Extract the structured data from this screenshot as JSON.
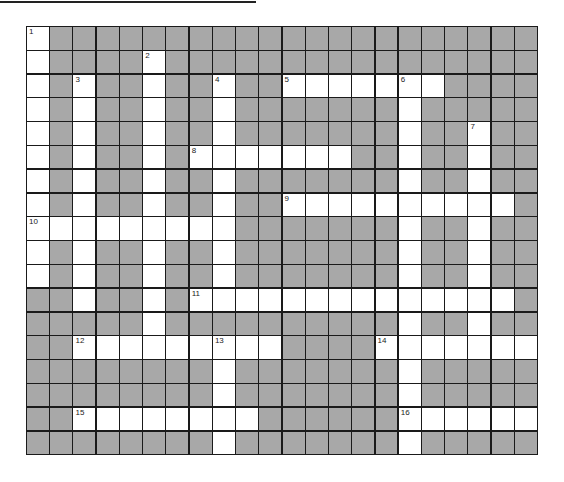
{
  "puzzle": {
    "rows": 18,
    "cols": 22,
    "colors": {
      "block": "#a8a8a8",
      "open": "#ffffff",
      "line": "#1a1a1a"
    },
    "open_cells": {
      "0": [
        0
      ],
      "1": [
        0,
        5
      ],
      "2": [
        0,
        2,
        5,
        8,
        11,
        12,
        13,
        14,
        15,
        16,
        17
      ],
      "3": [
        0,
        2,
        5,
        8,
        16
      ],
      "4": [
        0,
        2,
        5,
        8,
        16,
        19
      ],
      "5": [
        0,
        2,
        5,
        7,
        8,
        9,
        10,
        11,
        12,
        13,
        16,
        19
      ],
      "6": [
        0,
        2,
        5,
        8,
        16,
        19
      ],
      "7": [
        0,
        2,
        5,
        8,
        11,
        12,
        13,
        14,
        15,
        16,
        17,
        18,
        19,
        20
      ],
      "8": [
        0,
        1,
        2,
        3,
        4,
        5,
        6,
        7,
        8,
        16,
        19
      ],
      "9": [
        0,
        2,
        5,
        8,
        16,
        19
      ],
      "10": [
        0,
        2,
        5,
        8,
        16,
        19
      ],
      "11": [
        2,
        5,
        7,
        8,
        9,
        10,
        11,
        12,
        13,
        14,
        15,
        16,
        17,
        18,
        19,
        20
      ],
      "12": [
        5,
        16,
        19
      ],
      "13": [
        2,
        3,
        4,
        5,
        6,
        7,
        8,
        9,
        10,
        15,
        16,
        17,
        18,
        19,
        20,
        21
      ],
      "14": [
        8,
        16
      ],
      "15": [
        8,
        16
      ],
      "16": [
        2,
        3,
        4,
        5,
        6,
        7,
        8,
        9,
        16,
        17,
        18,
        19,
        20,
        21
      ],
      "17": [
        8,
        16
      ]
    },
    "numbers": [
      {
        "n": "1",
        "r": 0,
        "c": 0
      },
      {
        "n": "2",
        "r": 1,
        "c": 5
      },
      {
        "n": "3",
        "r": 2,
        "c": 2
      },
      {
        "n": "4",
        "r": 2,
        "c": 8
      },
      {
        "n": "5",
        "r": 2,
        "c": 11
      },
      {
        "n": "6",
        "r": 2,
        "c": 16
      },
      {
        "n": "7",
        "r": 4,
        "c": 19
      },
      {
        "n": "8",
        "r": 5,
        "c": 7
      },
      {
        "n": "9",
        "r": 7,
        "c": 11
      },
      {
        "n": "10",
        "r": 8,
        "c": 0
      },
      {
        "n": "11",
        "r": 11,
        "c": 7
      },
      {
        "n": "12",
        "r": 13,
        "c": 2
      },
      {
        "n": "13",
        "r": 13,
        "c": 8
      },
      {
        "n": "14",
        "r": 13,
        "c": 15
      },
      {
        "n": "15",
        "r": 16,
        "c": 2
      },
      {
        "n": "16",
        "r": 16,
        "c": 16
      }
    ]
  }
}
